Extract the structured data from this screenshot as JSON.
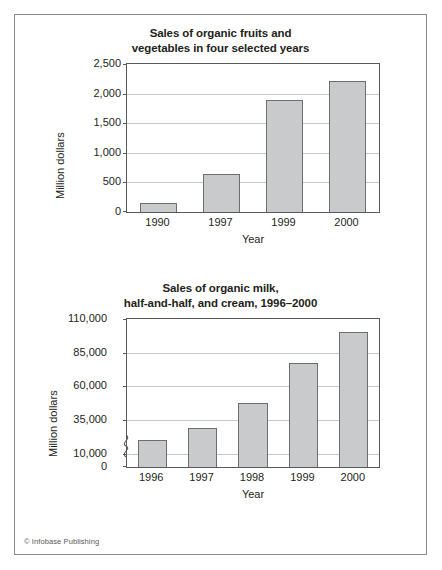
{
  "page": {
    "credit": "© Infobase Publishing"
  },
  "chart_data": [
    {
      "type": "bar",
      "title": "Sales of organic fruits and vegetables in four selected years",
      "title_line1": "Sales of organic fruits and",
      "title_line2": "vegetables in four selected years",
      "categories": [
        "1990",
        "1997",
        "1999",
        "2000"
      ],
      "values": [
        150,
        650,
        1900,
        2210
      ],
      "xlabel": "Year",
      "ylabel": "Million dollars",
      "ylim": [
        0,
        2500
      ],
      "yticks": [
        0,
        500,
        1000,
        1500,
        2000,
        2500
      ],
      "ytick_labels": [
        "0",
        "500",
        "1,000",
        "1,500",
        "2,000",
        "2,500"
      ],
      "grid": true,
      "legend": "none",
      "bar_fill": "#c9cacb",
      "bar_stroke": "#6d6e70",
      "axis_break": false
    },
    {
      "type": "bar",
      "title": "Sales of organic milk, half-and-half, and cream, 1996–2000",
      "title_line1": "Sales of organic milk,",
      "title_line2": "half-and-half, and cream, 1996–2000",
      "categories": [
        "1996",
        "1997",
        "1998",
        "1999",
        "2000"
      ],
      "values": [
        20000,
        29000,
        47500,
        77000,
        100000
      ],
      "xlabel": "Year",
      "ylabel": "Million dollars",
      "ylim": [
        0,
        110000
      ],
      "yticks": [
        0,
        10000,
        35000,
        60000,
        85000,
        110000
      ],
      "ytick_labels": [
        "0",
        "10,000",
        "35,000",
        "60,000",
        "85,000",
        "110,000"
      ],
      "grid": true,
      "legend": "none",
      "bar_fill": "#c9cacb",
      "bar_stroke": "#6d6e70",
      "axis_break": true,
      "axis_break_note": "y-axis broken between 0 and 10,000"
    }
  ]
}
